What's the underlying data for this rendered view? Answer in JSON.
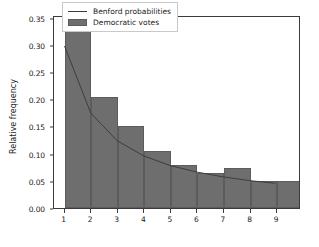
{
  "chart_data": {
    "type": "bar",
    "title": "",
    "xlabel": "Digits",
    "ylabel": "Relative frequency",
    "categories": [
      "1",
      "2",
      "3",
      "4",
      "5",
      "6",
      "7",
      "8",
      "9"
    ],
    "xlim": [
      0.6,
      9.9
    ],
    "ylim": [
      0.0,
      0.355
    ],
    "grid": false,
    "legend_position": "upper center",
    "xticks": [
      "1",
      "2",
      "3",
      "4",
      "5",
      "6",
      "7",
      "8",
      "9"
    ],
    "yticks": [
      "0.00",
      "0.05",
      "0.10",
      "0.15",
      "0.20",
      "0.25",
      "0.30",
      "0.35"
    ],
    "ytick_values": [
      0.0,
      0.05,
      0.1,
      0.15,
      0.2,
      0.25,
      0.3,
      0.35
    ],
    "series": [
      {
        "name": "Democratic votes",
        "type": "bar",
        "color": "#6e6e6e",
        "values": [
          0.337,
          0.205,
          0.15,
          0.104,
          0.08,
          0.065,
          0.073,
          0.049,
          0.049
        ]
      },
      {
        "name": "Benford probabilities",
        "type": "line",
        "color": "#3d3d3d",
        "values": [
          0.301,
          0.176,
          0.125,
          0.097,
          0.079,
          0.067,
          0.058,
          0.051,
          0.046
        ]
      }
    ]
  },
  "legend": {
    "entries": [
      {
        "label": "Benford probabilities",
        "marker": "line-glyph"
      },
      {
        "label": "Democratic votes",
        "marker": "patch-glyph"
      }
    ]
  },
  "colors": {
    "bar_fill": "#6e6e6e",
    "bar_edge": "#5c5c5c",
    "line": "#3d3d3d",
    "axis": "#3b3b3b",
    "text": "#1a1a1a",
    "background": "#ffffff"
  }
}
